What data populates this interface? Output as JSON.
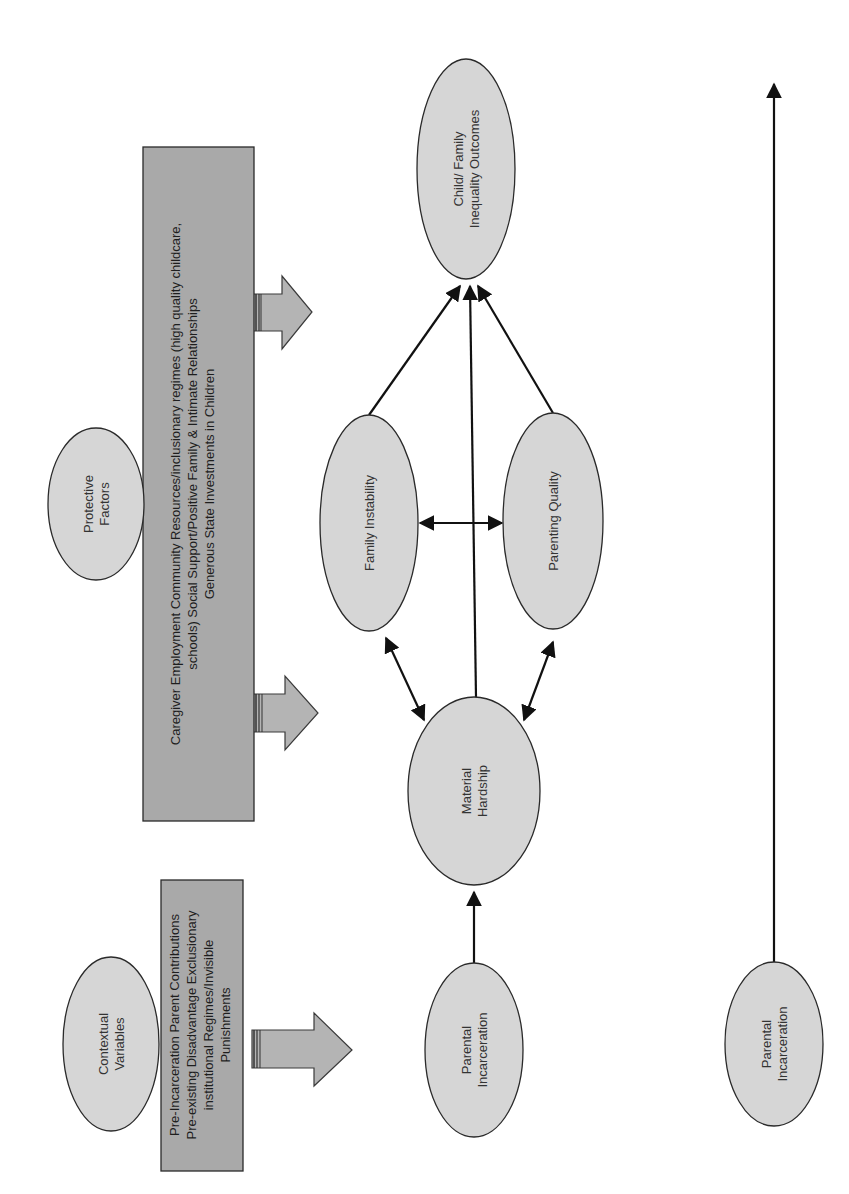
{
  "diagram": {
    "orientation": "rotated 90deg counter-clockwise (read by turning page clockwise)",
    "nodes": {
      "contextual_variables": {
        "line1": "Contextual",
        "line2": "Variables"
      },
      "contextual_box": {
        "line1": "Pre-Incarceration Parent Contributions",
        "line2": "Pre-existing Disadvantage Exclusionary",
        "line3": "institutional Regimes/Invisible",
        "line4": "Punishments"
      },
      "protective_factors": {
        "line1": "Protective",
        "line2": "Factors"
      },
      "protective_box": {
        "line1": "Caregiver Employment Community Resources/inclusionary regimes (high quality childcare,",
        "line2": "schools) Social Support/Positive Family & Intimate Relationships",
        "line3": "Generous State Investments in Children"
      },
      "parental_incarceration": {
        "line1": "Parental",
        "line2": "Incarceration"
      },
      "material_hardship": {
        "line1": "Material",
        "line2": "Hardship"
      },
      "family_instability": {
        "line1": "Family Instability"
      },
      "parenting_quality": {
        "line1": "Parenting Quality"
      },
      "outcomes": {
        "line1": "Child/ Family",
        "line2": "Inequality Outcomes"
      },
      "parental_incarceration_timeline": {
        "line1": "Parental",
        "line2": "Incarceration"
      }
    },
    "edges": [
      {
        "from": "Contextual box",
        "to": "Parental Incarceration",
        "type": "block-arrow"
      },
      {
        "from": "Protective box",
        "to": "Material Hardship",
        "type": "block-arrow"
      },
      {
        "from": "Protective box",
        "to": "Child/Family Inequality Outcomes",
        "type": "block-arrow"
      },
      {
        "from": "Parental Incarceration",
        "to": "Material Hardship",
        "type": "arrow"
      },
      {
        "from": "Material Hardship",
        "to": "Family Instability",
        "type": "bidirectional"
      },
      {
        "from": "Material Hardship",
        "to": "Parenting Quality",
        "type": "bidirectional"
      },
      {
        "from": "Family Instability",
        "to": "Parenting Quality",
        "type": "bidirectional"
      },
      {
        "from": "Material Hardship",
        "to": "Child/Family Inequality Outcomes",
        "type": "arrow"
      },
      {
        "from": "Family Instability",
        "to": "Child/Family Inequality Outcomes",
        "type": "arrow"
      },
      {
        "from": "Parenting Quality",
        "to": "Child/Family Inequality Outcomes",
        "type": "arrow"
      },
      {
        "from": "Parental Incarceration (timeline)",
        "to": "end of timeline",
        "type": "arrow"
      }
    ],
    "colors": {
      "ellipse_fill": "#d6d6d6",
      "box_fill": "#a9a9a9",
      "block_arrow_fill": "#b4b4b4",
      "line": "#111111"
    }
  }
}
